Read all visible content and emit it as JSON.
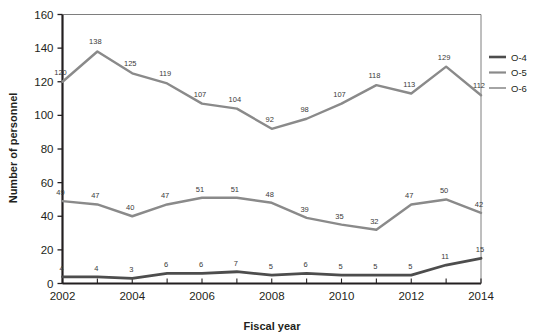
{
  "chart_data": {
    "type": "line",
    "title": "",
    "xlabel": "Fiscal year",
    "ylabel": "Number of personnel",
    "x": [
      2002,
      2003,
      2004,
      2005,
      2006,
      2007,
      2008,
      2009,
      2010,
      2011,
      2012,
      2013,
      2014
    ],
    "xlim": [
      2002,
      2014
    ],
    "ylim": [
      0,
      160
    ],
    "ytick_values": [
      0,
      20,
      40,
      60,
      80,
      100,
      120,
      140,
      160
    ],
    "ytick_labels": [
      "0",
      "20",
      "40",
      "60",
      "80",
      "100",
      "120",
      "140",
      "160"
    ],
    "xtick_values": [
      2002,
      2004,
      2006,
      2008,
      2010,
      2012,
      2014
    ],
    "xtick_labels": [
      "2002",
      "2004",
      "2006",
      "2008",
      "2010",
      "2012",
      "2014"
    ],
    "grid": false,
    "legend_position": "right",
    "series": [
      {
        "name": "O-4",
        "color": "#4d4d4d",
        "values": [
          4,
          4,
          3,
          6,
          6,
          7,
          5,
          6,
          5,
          5,
          5,
          11,
          15
        ],
        "labels": [
          "4",
          "4",
          "3",
          "6",
          "6",
          "7",
          "5",
          "6",
          "5",
          "5",
          "5",
          "11",
          "15"
        ]
      },
      {
        "name": "O-5",
        "color": "#8a8a8a",
        "values": [
          49,
          47,
          40,
          47,
          51,
          51,
          48,
          39,
          35,
          32,
          47,
          50,
          42
        ],
        "labels": [
          "49",
          "47",
          "40",
          "47",
          "51",
          "51",
          "48",
          "39",
          "35",
          "32",
          "47",
          "50",
          "42"
        ]
      },
      {
        "name": "O-6",
        "color": "#8a8a8a",
        "values": [
          120,
          138,
          125,
          119,
          107,
          104,
          92,
          98,
          107,
          118,
          113,
          129,
          112
        ],
        "labels": [
          "120",
          "138",
          "125",
          "119",
          "107",
          "104",
          "92",
          "98",
          "107",
          "118",
          "113",
          "129",
          "112"
        ]
      }
    ]
  },
  "legend": {
    "items": [
      {
        "label": "O-4",
        "color": "#4d4d4d",
        "width": 2.6
      },
      {
        "label": "O-5",
        "color": "#8a8a8a",
        "width": 2.2
      },
      {
        "label": "O-6",
        "color": "#9a9a9a",
        "width": 1.8
      }
    ]
  },
  "axes": {
    "y_title": "Number of personnel",
    "x_title": "Fiscal year"
  }
}
